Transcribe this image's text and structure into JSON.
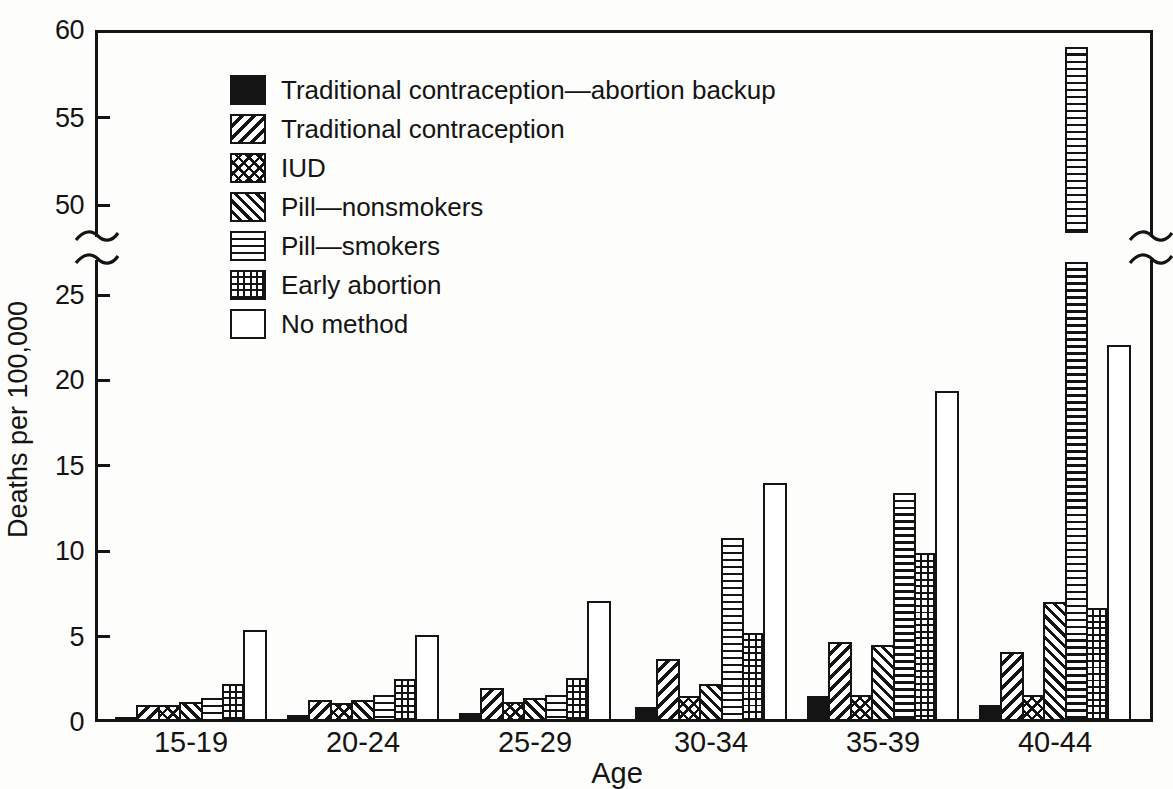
{
  "colors": {
    "ink": "#141414",
    "paper": "#fdfdfb"
  },
  "chart_data": {
    "type": "bar",
    "title": "",
    "xlabel": "Age",
    "ylabel": "Deaths per 100,000",
    "grid": false,
    "legend_position": "upper-left-inside",
    "categories": [
      "15-19",
      "20-24",
      "25-29",
      "30-34",
      "35-39",
      "40-44"
    ],
    "series": [
      {
        "key": "trad-abortion-backup",
        "name": "Traditional contraception—abortion backup",
        "pattern": "solid-black",
        "values": [
          0.3,
          0.4,
          0.5,
          0.9,
          1.5,
          1.0
        ]
      },
      {
        "key": "traditional",
        "name": "Traditional contraception",
        "pattern": "diagonal-hatch-forward",
        "values": [
          1.0,
          1.3,
          2.0,
          3.7,
          4.7,
          4.1
        ]
      },
      {
        "key": "iud",
        "name": "IUD",
        "pattern": "diamond-crosshatch",
        "values": [
          1.0,
          1.1,
          1.2,
          1.5,
          1.6,
          1.6
        ]
      },
      {
        "key": "pill-nonsmokers",
        "name": "Pill—nonsmokers",
        "pattern": "diagonal-hatch-backward",
        "values": [
          1.2,
          1.3,
          1.4,
          2.2,
          4.5,
          7.0
        ]
      },
      {
        "key": "pill-smokers",
        "name": "Pill—smokers",
        "pattern": "horizontal-lines",
        "values": [
          1.4,
          1.6,
          1.6,
          10.8,
          13.4,
          59.0
        ]
      },
      {
        "key": "early-abortion",
        "name": "Early abortion",
        "pattern": "grid-crosshatch",
        "values": [
          2.2,
          2.5,
          2.6,
          5.2,
          9.9,
          6.7
        ]
      },
      {
        "key": "no-method",
        "name": "No method",
        "pattern": "open-white",
        "values": [
          5.4,
          5.1,
          7.1,
          14.0,
          19.4,
          22.1
        ]
      }
    ],
    "y_axis": {
      "lower_ticks": [
        0,
        5,
        10,
        15,
        20,
        25
      ],
      "upper_ticks": [
        50,
        55,
        60
      ],
      "axis_break_between": [
        25,
        50
      ],
      "lower_range": [
        0,
        27
      ],
      "upper_range": [
        48,
        60
      ]
    },
    "broken_bar": {
      "category": "40-44",
      "series": "Pill—smokers",
      "value": 59.0
    }
  }
}
